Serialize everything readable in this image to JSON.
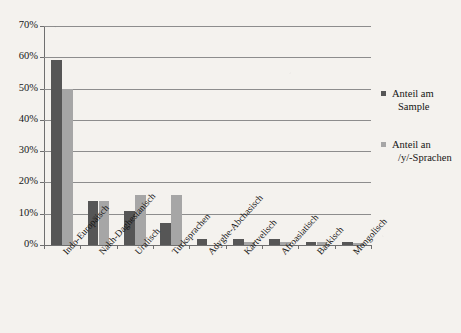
{
  "chart_data": {
    "type": "bar",
    "title": "",
    "xlabel": "",
    "ylabel": "",
    "ylim": [
      0,
      70
    ],
    "ytick_labels": [
      "0%",
      "10%",
      "20%",
      "30%",
      "40%",
      "50%",
      "60%",
      "70%"
    ],
    "ytick_values": [
      0,
      10,
      20,
      30,
      40,
      50,
      60,
      70
    ],
    "grid": true,
    "legend_position": "right",
    "categories": [
      "Indo-Europäisch",
      "Nakh-Daghestanisch",
      "Uralisch",
      "Turksprachen",
      "Adyghe-Abchasisch",
      "Kartvelisch",
      "Afroasiatisch",
      "Baskisch",
      "Mongolisch"
    ],
    "series": [
      {
        "name": "Anteil am Sample",
        "color": "#565656",
        "values": [
          59,
          14,
          11,
          7,
          2,
          2,
          2,
          1,
          1
        ]
      },
      {
        "name": "Anteil an /y/-Sprachen",
        "color": "#a6a6a6",
        "values": [
          50,
          14,
          16,
          16,
          0,
          1,
          1,
          1,
          0.7
        ]
      }
    ]
  },
  "legend": {
    "items": [
      {
        "line1": "Anteil am",
        "line2": "Sample",
        "swatch": "dark"
      },
      {
        "line1": "Anteil an",
        "line2": "/y/-Sprachen",
        "swatch": "light"
      }
    ]
  }
}
